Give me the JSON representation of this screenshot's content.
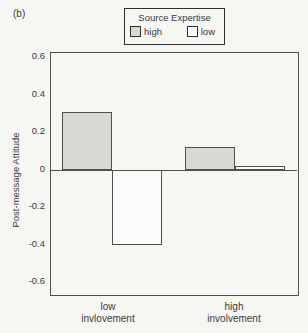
{
  "figure_label": "(b)",
  "legend": {
    "title": "Source Expertise",
    "items": [
      {
        "label": "high",
        "color": "#d8d8d5"
      },
      {
        "label": "low",
        "color": "#fbfbf9"
      }
    ]
  },
  "chart_data": {
    "type": "bar",
    "title": "",
    "xlabel": "",
    "ylabel": "Post-message Attitude",
    "categories": [
      {
        "lines": [
          "low",
          "invlovement"
        ]
      },
      {
        "lines": [
          "high",
          "involvement"
        ]
      }
    ],
    "series": [
      {
        "name": "high",
        "values": [
          0.31,
          0.12
        ],
        "fill": "#d8d8d5"
      },
      {
        "name": "low",
        "values": [
          -0.4,
          0.02
        ],
        "fill": "#fbfbf9"
      }
    ],
    "yticks": [
      0.6,
      0.4,
      0.2,
      0,
      -0.2,
      -0.4,
      -0.6
    ],
    "ytick_labels": [
      "0.6",
      "0.4",
      "0.2",
      "0",
      "-0.2",
      "-0.4",
      "-0.6"
    ],
    "ylim": [
      -0.662,
      0.629
    ],
    "grid": false,
    "legend_position": "top",
    "border_color": "#4f4f4f"
  }
}
